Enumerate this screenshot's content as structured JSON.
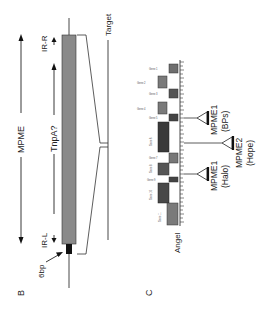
{
  "panel_b": {
    "panel_label": "B",
    "element_label": "MPME",
    "orf_label": "TnpA?",
    "ir_right_label": "IR-R",
    "ir_left_label": "IR-L",
    "dup_label": "6bp",
    "target_label": "Target",
    "colors": {
      "element_fill": "#8a8a8a",
      "dup_fill": "#111111",
      "line": "#333333"
    }
  },
  "panel_c": {
    "panel_label": "C",
    "locus_label": "Angel",
    "insertions": [
      {
        "name": "MPME1",
        "origin": "(BPs)"
      },
      {
        "name": "MPME2",
        "origin": "(Hope)"
      },
      {
        "name": "MPME1",
        "origin": "(Halo)"
      }
    ],
    "genes": [
      {
        "label": "Gene 1",
        "color": "#6e6e6e"
      },
      {
        "label": "Gene 2",
        "color": "#7a7a7a"
      },
      {
        "label": "Gene 3",
        "color": "#555555"
      },
      {
        "label": "Gene 4",
        "color": "#7a7a7a"
      },
      {
        "label": "Gene 5",
        "color": "#444444"
      },
      {
        "label": "Gene 6",
        "color": "#3a3a3a"
      },
      {
        "label": "Gene 7",
        "color": "#777777"
      },
      {
        "label": "Gene 8",
        "color": "#555555"
      },
      {
        "label": "Gene 9",
        "color": "#444444"
      },
      {
        "label": "Gene 10",
        "color": "#484848"
      },
      {
        "label": "Gene 11",
        "color": "#7a7a7a"
      }
    ]
  }
}
